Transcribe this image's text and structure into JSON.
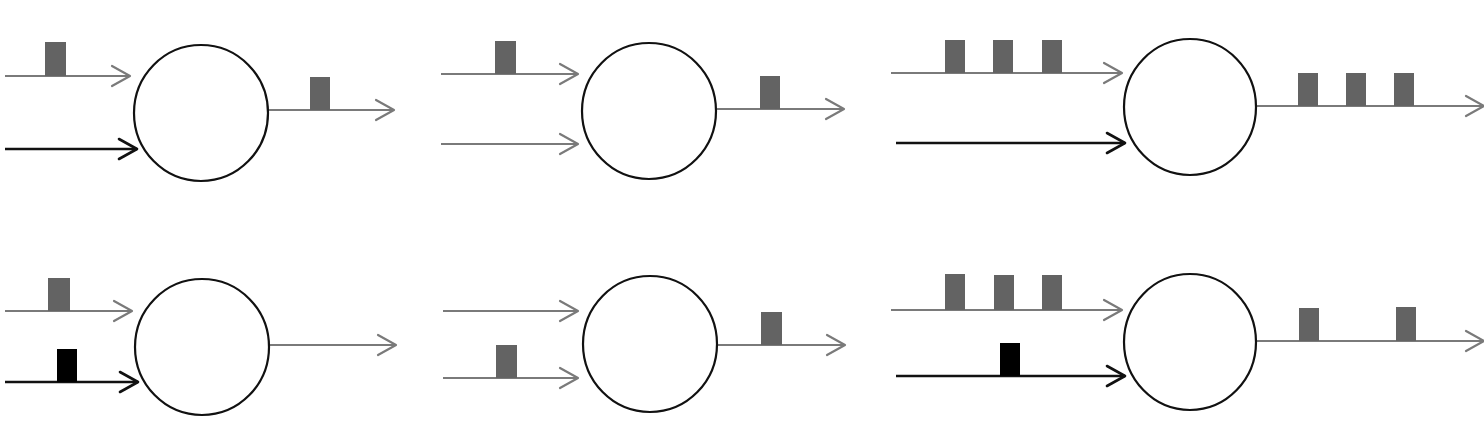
{
  "colors": {
    "background": "#ffffff",
    "gray_line": "#7a7a7a",
    "gray_pulse": "#636363",
    "black_line": "#111111",
    "black_pulse": "#000000",
    "circle_stroke": "#111111"
  },
  "panels": [
    {
      "id": "top-left",
      "circle": {
        "cx": 201,
        "cy": 113,
        "rx": 67,
        "ry": 68
      },
      "inputs": [
        {
          "x1": 5,
          "x2": 130,
          "y": 76,
          "style": "gray",
          "pulses": [
            {
              "x": 45,
              "w": 21,
              "h": 34
            }
          ]
        },
        {
          "x1": 5,
          "x2": 137,
          "y": 149,
          "style": "black",
          "pulses": []
        }
      ],
      "output": {
        "x1": 268,
        "x2": 394,
        "y": 110,
        "style": "gray",
        "pulses": [
          {
            "x": 310,
            "w": 20,
            "h": 33
          }
        ]
      }
    },
    {
      "id": "top-middle",
      "circle": {
        "cx": 649,
        "cy": 111,
        "rx": 67,
        "ry": 68
      },
      "inputs": [
        {
          "x1": 441,
          "x2": 578,
          "y": 74,
          "style": "gray",
          "pulses": [
            {
              "x": 495,
              "w": 21,
              "h": 33
            }
          ]
        },
        {
          "x1": 441,
          "x2": 578,
          "y": 144,
          "style": "gray",
          "pulses": []
        }
      ],
      "output": {
        "x1": 717,
        "x2": 844,
        "y": 109,
        "style": "gray",
        "pulses": [
          {
            "x": 760,
            "w": 20,
            "h": 33
          }
        ]
      }
    },
    {
      "id": "top-right",
      "circle": {
        "cx": 1190,
        "cy": 107,
        "rx": 66,
        "ry": 68
      },
      "inputs": [
        {
          "x1": 891,
          "x2": 1122,
          "y": 73,
          "style": "gray",
          "pulses": [
            {
              "x": 945,
              "w": 20,
              "h": 33
            },
            {
              "x": 993,
              "w": 20,
              "h": 33
            },
            {
              "x": 1042,
              "w": 20,
              "h": 33
            }
          ]
        },
        {
          "x1": 896,
          "x2": 1125,
          "y": 143,
          "style": "black",
          "pulses": []
        }
      ],
      "output": {
        "x1": 1257,
        "x2": 1484,
        "y": 106,
        "style": "gray",
        "pulses": [
          {
            "x": 1298,
            "w": 20,
            "h": 33
          },
          {
            "x": 1346,
            "w": 20,
            "h": 33
          },
          {
            "x": 1394,
            "w": 20,
            "h": 33
          }
        ]
      }
    },
    {
      "id": "bottom-left",
      "circle": {
        "cx": 202,
        "cy": 347,
        "rx": 67,
        "ry": 68
      },
      "inputs": [
        {
          "x1": 5,
          "x2": 132,
          "y": 311,
          "style": "gray",
          "pulses": [
            {
              "x": 48,
              "w": 22,
              "h": 33
            }
          ]
        },
        {
          "x1": 5,
          "x2": 138,
          "y": 382,
          "style": "black",
          "pulses": [
            {
              "x": 57,
              "w": 20,
              "h": 33
            }
          ]
        }
      ],
      "output": {
        "x1": 270,
        "x2": 396,
        "y": 345,
        "style": "gray",
        "pulses": []
      }
    },
    {
      "id": "bottom-middle",
      "circle": {
        "cx": 650,
        "cy": 344,
        "rx": 67,
        "ry": 68
      },
      "inputs": [
        {
          "x1": 443,
          "x2": 578,
          "y": 311,
          "style": "gray",
          "pulses": []
        },
        {
          "x1": 443,
          "x2": 578,
          "y": 378,
          "style": "gray",
          "pulses": [
            {
              "x": 496,
              "w": 21,
              "h": 33
            }
          ]
        }
      ],
      "output": {
        "x1": 718,
        "x2": 845,
        "y": 345,
        "style": "gray",
        "pulses": [
          {
            "x": 761,
            "w": 21,
            "h": 33
          }
        ]
      }
    },
    {
      "id": "bottom-right",
      "circle": {
        "cx": 1190,
        "cy": 342,
        "rx": 66,
        "ry": 68
      },
      "inputs": [
        {
          "x1": 891,
          "x2": 1122,
          "y": 310,
          "style": "gray",
          "pulses": [
            {
              "x": 945,
              "w": 20,
              "h": 36
            },
            {
              "x": 994,
              "w": 20,
              "h": 35
            },
            {
              "x": 1042,
              "w": 20,
              "h": 35
            }
          ]
        },
        {
          "x1": 896,
          "x2": 1125,
          "y": 376,
          "style": "black",
          "pulses": [
            {
              "x": 1000,
              "w": 20,
              "h": 33
            }
          ]
        }
      ],
      "output": {
        "x1": 1257,
        "x2": 1484,
        "y": 341,
        "style": "gray",
        "pulses": [
          {
            "x": 1299,
            "w": 20,
            "h": 33
          },
          {
            "x": 1396,
            "w": 20,
            "h": 34
          }
        ]
      }
    }
  ]
}
